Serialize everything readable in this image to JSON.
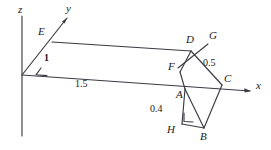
{
  "figure": {
    "stroke_color": "#3a3a42",
    "background": "#ffffff",
    "axes": [
      {
        "name": "z",
        "label": "z"
      },
      {
        "name": "y",
        "label": "y"
      },
      {
        "name": "x",
        "label": "x"
      }
    ],
    "points": [
      {
        "id": "E",
        "label": "E",
        "x": 40,
        "y": 31
      },
      {
        "id": "D",
        "label": "D",
        "x": 188,
        "y": 40
      },
      {
        "id": "G",
        "label": "G",
        "x": 211,
        "y": 36
      },
      {
        "id": "F",
        "label": "F",
        "x": 170,
        "y": 65
      },
      {
        "id": "C",
        "label": "C",
        "x": 225,
        "y": 78
      },
      {
        "id": "A",
        "label": "A",
        "x": 178,
        "y": 92
      },
      {
        "id": "H",
        "label": "H",
        "x": 170,
        "y": 127
      },
      {
        "id": "B",
        "label": "B",
        "x": 202,
        "y": 134
      }
    ],
    "measurements": [
      {
        "id": "edge-y",
        "label": "1",
        "x": 45,
        "y": 57
      },
      {
        "id": "edge-x",
        "label": "1.5",
        "x": 77,
        "y": 80
      },
      {
        "id": "edge-dc",
        "label": "0.5",
        "x": 205,
        "y": 60
      },
      {
        "id": "edge-ah",
        "label": "0.4",
        "x": 152,
        "y": 106
      }
    ],
    "axis_labels": [
      {
        "id": "z-axis-label",
        "label": "z",
        "x": 18,
        "y": 6
      },
      {
        "id": "y-axis-label",
        "label": "y",
        "x": 66,
        "y": 6
      },
      {
        "id": "x-axis-label",
        "label": "x",
        "x": 256,
        "y": 82
      }
    ],
    "angle_markers": [
      {
        "id": "origin-angle",
        "note": "angle arc at origin between y-axis and x-axis"
      },
      {
        "id": "right-angle-h",
        "note": "right angle square at H"
      }
    ]
  }
}
